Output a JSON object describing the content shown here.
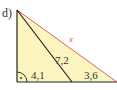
{
  "problem": {
    "part_label": "d)"
  },
  "figure": {
    "type": "right-triangle",
    "fill_color": "#fdf5c0",
    "edge_color": "#222222",
    "hypotenuse_color": "#e0625a",
    "labels": {
      "hypotenuse": "x",
      "inner_segment": "7,2",
      "base_left": "4,1",
      "base_right": "3,6"
    },
    "right_angle_marker": "right-angle-with-dot"
  }
}
